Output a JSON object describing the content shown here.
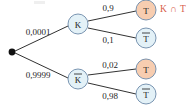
{
  "diagram": {
    "type": "probability-tree",
    "title": "",
    "background_color": "#ffffff",
    "root": {
      "name": "root-node",
      "label": ""
    },
    "colors": {
      "node_stroke": "#6c89a8",
      "node_fill_blue": "#e3f1f7",
      "node_fill_orange": "#f7cdb0",
      "edge": "#1a1a1a",
      "text": "#1a1a1a",
      "annotation": "#d8604a"
    },
    "nodes": {
      "k": "K",
      "k_not": "K",
      "t_top": "T",
      "t_not_top": "T",
      "t_bottom": "T",
      "t_not_bottom": "T"
    },
    "edges": [
      {
        "name": "root-to-k",
        "label": "0,0001",
        "from": "root",
        "to": "K"
      },
      {
        "name": "root-to-k-not",
        "label": "0,9999",
        "from": "root",
        "to": "K-bar"
      },
      {
        "name": "k-to-t",
        "label": "0,9",
        "from": "K",
        "to": "T"
      },
      {
        "name": "k-to-t-not",
        "label": "0,1",
        "from": "K",
        "to": "T-bar"
      },
      {
        "name": "k-not-to-t",
        "label": "0,02",
        "from": "K-bar",
        "to": "T"
      },
      {
        "name": "k-not-to-t-not",
        "label": "0,98",
        "from": "K-bar",
        "to": "T-bar"
      }
    ],
    "annotation": {
      "name": "intersection-annotation",
      "label": "K ∩ T"
    }
  }
}
